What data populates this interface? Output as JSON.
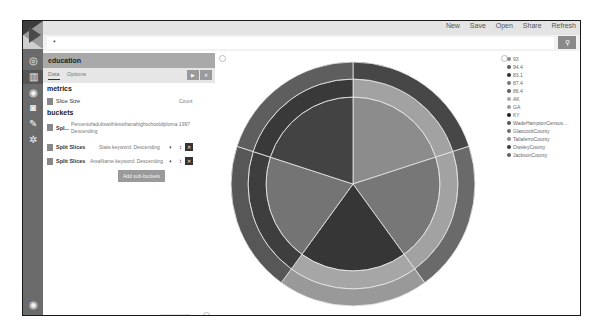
{
  "topnav": {
    "items": [
      "New",
      "Save",
      "Open",
      "Share",
      "Refresh"
    ]
  },
  "search": {
    "value": "*",
    "button_icon": "search-icon"
  },
  "sidebar": {
    "icons": [
      "logo",
      "discover-icon",
      "visualize-icon",
      "dashboard-icon",
      "timelion-icon",
      "devtools-icon",
      "settings-icon",
      "collapse-icon"
    ]
  },
  "panel": {
    "index_name": "education",
    "tabs": [
      {
        "label": "Data",
        "active": true
      },
      {
        "label": "Options",
        "active": false
      }
    ],
    "buttons": {
      "apply": "▶",
      "discard": "✕"
    },
    "metrics_title": "metrics",
    "metric": {
      "label": "Slice Size",
      "value": "Count"
    },
    "buckets_title": "buckets",
    "buckets": [
      {
        "label": "Spl...",
        "desc": "Percentofadultswithlessthanahighschooldiploma 1997",
        "desc2": "Descending"
      },
      {
        "label": "Split Slices",
        "desc": "State.keyword: Descending"
      },
      {
        "label": "Split Slices",
        "desc": "AreaName.keyword: Descending"
      }
    ],
    "add_sub_buckets": "Add sub-buckets"
  },
  "legend": {
    "items": [
      {
        "label": "93",
        "color": "#8c8c8c"
      },
      {
        "label": "94.4",
        "color": "#5a5a5a"
      },
      {
        "label": "83.1",
        "color": "#2e2e2e"
      },
      {
        "label": "87.4",
        "color": "#7a7a7a"
      },
      {
        "label": "86.4",
        "color": "#5e5e5e"
      },
      {
        "label": "AK",
        "color": "#a8a8a8"
      },
      {
        "label": "GA",
        "color": "#9a9a9a"
      },
      {
        "label": "KY",
        "color": "#1e1e1e"
      },
      {
        "label": "WadeHamptonCensus...",
        "color": "#555555"
      },
      {
        "label": "GlascockCounty",
        "color": "#6e6e6e"
      },
      {
        "label": "TaliaferroCounty",
        "color": "#8a8a8a"
      },
      {
        "label": "OwsleyCounty",
        "color": "#3a3a3a"
      },
      {
        "label": "JacksonCounty",
        "color": "#606060"
      }
    ]
  },
  "chart_data": {
    "type": "pie",
    "title": "",
    "rings": [
      {
        "level": "Percentofadultswithlessthanahighschooldiploma 1997",
        "slices": [
          {
            "label": "93",
            "value": 1,
            "color": "#8c8c8c"
          },
          {
            "label": "94.4",
            "value": 1,
            "color": "#777777"
          },
          {
            "label": "83.1",
            "value": 1,
            "color": "#363636"
          },
          {
            "label": "87.4",
            "value": 1,
            "color": "#747474"
          },
          {
            "label": "86.4",
            "value": 1,
            "color": "#434343"
          }
        ]
      },
      {
        "level": "State.keyword",
        "slices": [
          {
            "label": "AK",
            "value": 1,
            "color": "#a2a2a2"
          },
          {
            "label": "AK",
            "value": 1,
            "color": "#a2a2a2"
          },
          {
            "label": "GA",
            "value": 1,
            "color": "#a6a6a6"
          },
          {
            "label": "KY",
            "value": 1,
            "color": "#3e3e3e"
          },
          {
            "label": "KY",
            "value": 1,
            "color": "#393939"
          }
        ]
      },
      {
        "level": "AreaName.keyword",
        "slices": [
          {
            "label": "WadeHamptonCensus...",
            "value": 1,
            "color": "#474747"
          },
          {
            "label": "GlascockCounty",
            "value": 1,
            "color": "#6a6a6a"
          },
          {
            "label": "TaliaferroCounty",
            "value": 1,
            "color": "#999999"
          },
          {
            "label": "OwsleyCounty",
            "value": 1,
            "color": "#575757"
          },
          {
            "label": "JacksonCounty",
            "value": 1,
            "color": "#5e5e5e"
          }
        ]
      }
    ]
  }
}
